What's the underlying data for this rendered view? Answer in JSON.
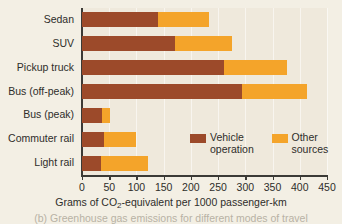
{
  "chart_data": {
    "type": "bar",
    "orientation": "horizontal",
    "stacked": true,
    "title": "",
    "xlabel": "Grams of CO2-equivalent per 1000 passenger-km",
    "ylabel": "",
    "xlim": [
      0,
      450
    ],
    "xticks": [
      0,
      50,
      100,
      150,
      200,
      250,
      300,
      350,
      400,
      450
    ],
    "xtick_labels": [
      "0",
      "50",
      "100",
      "150",
      "200",
      "250",
      "300",
      "350",
      "400",
      "450"
    ],
    "grid": true,
    "legend_position": "inside-lower-right",
    "categories": [
      "Sedan",
      "SUV",
      "Pickup truck",
      "Bus (off-peak)",
      "Bus (peak)",
      "Commuter rail",
      "Light rail"
    ],
    "series": [
      {
        "name": "Vehicle operation",
        "color": "#9c4a2a",
        "values": [
          140,
          170,
          260,
          294,
          37,
          40,
          35
        ]
      },
      {
        "name": "Other sources",
        "color": "#f4a42a",
        "values": [
          93,
          105,
          117,
          119,
          15,
          59,
          86
        ]
      }
    ],
    "totals": [
      233,
      275,
      377,
      413,
      52,
      99,
      121
    ]
  },
  "axis": {
    "x_title_prefix": "Grams of CO",
    "x_title_sub": "2",
    "x_title_suffix": "-equivalent per 1000 passenger-km"
  },
  "legend": {
    "entries": [
      {
        "label": "Vehicle operation",
        "swatch": "vehicle"
      },
      {
        "label": "Other sources",
        "swatch": "other"
      }
    ]
  },
  "caption": {
    "partial_text": "(b) Greenhouse gas emissions for different modes of travel"
  },
  "colors": {
    "vehicle_operation": "#9c4a2a",
    "other_sources": "#f4a42a",
    "background": "#f3efe4",
    "plot_background": "#efe9dc",
    "axis": "#3b3a36",
    "text": "#2e2d2a"
  }
}
